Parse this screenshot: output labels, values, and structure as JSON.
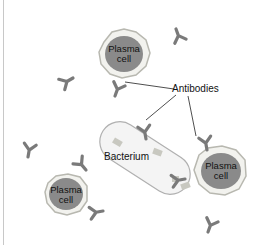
{
  "diagram": {
    "labels": {
      "plasma_cell_top": [
        "Plasma",
        "cell"
      ],
      "plasma_cell_bottom_left": [
        "Plasma",
        "cell"
      ],
      "plasma_cell_right": [
        "Plasma",
        "cell"
      ],
      "antibodies": "Antibodies",
      "bacterium": "Bacterium"
    },
    "colors": {
      "nucleus": "#8a8a8a",
      "cytoplasm": "#f2f2ee",
      "membrane": "#b8b8b0",
      "antibody": "#7a7a7a",
      "bacterium_fill": "#f4f4f4",
      "bacterium_stroke": "#b0b0b0",
      "antigen": "#c8c8c0",
      "leader_line": "#222222"
    }
  }
}
